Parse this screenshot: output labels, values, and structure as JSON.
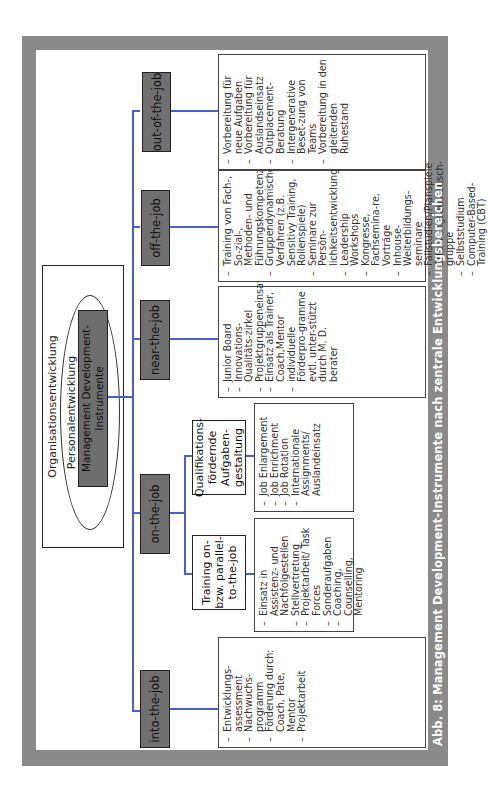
{
  "figure": {
    "caption": "Abb. 8: Management Development-Instrumente nach zentrale Entwicklungsbereichen",
    "colors": {
      "frame": "#8a8a8a",
      "category_box": "#707070",
      "connector": "#4a5fc8"
    }
  },
  "hierarchy": {
    "outer": "Organisationsentwicklung",
    "middle": "Personalentwicklung",
    "core": "Management Development-Instrumente"
  },
  "categories": [
    {
      "label": "into-the-job",
      "items": [
        "Entwicklungs-assessment",
        "Nachwuchs-programm",
        "Förderung durch: Coach, Pate, Mentor",
        "Projektarbeit"
      ]
    },
    {
      "label": "on-the-job",
      "subcategories": [
        {
          "label": "Training on- bzw. parallel-to-the-job",
          "items": [
            "Einsatz in Assistenz- und Nachfolgestellen",
            "Stellvertretung",
            "Projektarbeit/ Task Forces",
            "Sonderaufgaben",
            "Coaching, Counselling, Mentoring"
          ]
        },
        {
          "label": "Qualifikations-fördernde Aufgaben-gestaltung",
          "items": [
            "Job Enlargement",
            "Job Enrichment",
            "Job Rotation",
            "Internationale Assignments/ Auslandeinsatz"
          ]
        }
      ]
    },
    {
      "label": "near-the-job",
      "items": [
        "Junior Board",
        "Innovations-Qualitäts-zirkel",
        "Projektgruppeneinsatz",
        "Einsatz als Trainer, Coach,Mentor",
        "individuelle Förderpro-gramme evtl. unter-stützt durch M. D. berater"
      ]
    },
    {
      "label": "off-the-job",
      "items": [
        "Training von Fach-, So-zial-, Methoden- und Führungskompetenz",
        "Gruppendynamische Verfahren (z.B. Sensitivy Training, Rollenspiele)",
        "Seminare zur Persön-lichkeitsentwicklung",
        "Leadership Workshops",
        "Kongresse, Fachsemina-re, Vorträge",
        "Inhouse-Weiterbildungs-seminare",
        "Fallstudien/Planspiele",
        "Erfahrungsaustausch-gruppe",
        "Selbststudium",
        "Computer-Based-Training (CBT)"
      ]
    },
    {
      "label": "out-of-the-job",
      "items": [
        "Vorbereitung für neue Aufgaben",
        "Vorbereitung für Auslandseinsatz",
        "Outplacement-Beratung",
        "Intergenerative Beset-zung von Teams",
        "Vorbereitung in den gleitenden Ruhestand"
      ]
    }
  ]
}
